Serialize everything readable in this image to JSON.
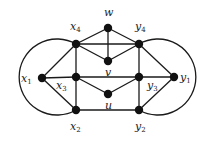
{
  "graph": {
    "nodes": [
      {
        "id": "w",
        "label": "w",
        "sub": "",
        "x": 108,
        "y": 28,
        "lx": 104,
        "ly": 16
      },
      {
        "id": "x4",
        "label": "x",
        "sub": "4",
        "x": 76,
        "y": 44,
        "lx": 70,
        "ly": 30
      },
      {
        "id": "y4",
        "label": "y",
        "sub": "4",
        "x": 139,
        "y": 44,
        "lx": 135,
        "ly": 30
      },
      {
        "id": "v",
        "label": "v",
        "sub": "",
        "x": 108,
        "y": 61,
        "lx": 105,
        "ly": 76
      },
      {
        "id": "x1",
        "label": "x",
        "sub": "1",
        "x": 42,
        "y": 78,
        "lx": 21,
        "ly": 82
      },
      {
        "id": "x3",
        "label": "x",
        "sub": "3",
        "x": 76,
        "y": 77,
        "lx": 56,
        "ly": 89
      },
      {
        "id": "y3",
        "label": "y",
        "sub": "3",
        "x": 139,
        "y": 77,
        "lx": 147,
        "ly": 89
      },
      {
        "id": "y1",
        "label": "y",
        "sub": "1",
        "x": 174,
        "y": 77,
        "lx": 180,
        "ly": 81
      },
      {
        "id": "u",
        "label": "u",
        "sub": "",
        "x": 108,
        "y": 94,
        "lx": 105,
        "ly": 109
      },
      {
        "id": "x2",
        "label": "x",
        "sub": "2",
        "x": 76,
        "y": 110,
        "lx": 70,
        "ly": 130
      },
      {
        "id": "y2",
        "label": "y",
        "sub": "2",
        "x": 139,
        "y": 110,
        "lx": 135,
        "ly": 130
      }
    ],
    "edges": [
      [
        "w",
        "x4"
      ],
      [
        "w",
        "y4"
      ],
      [
        "w",
        "v"
      ],
      [
        "x4",
        "y4"
      ],
      [
        "x4",
        "v"
      ],
      [
        "y4",
        "v"
      ],
      [
        "x4",
        "x1"
      ],
      [
        "x4",
        "x3"
      ],
      [
        "y4",
        "y3"
      ],
      [
        "y4",
        "y1"
      ],
      [
        "x1",
        "x3"
      ],
      [
        "x3",
        "y3"
      ],
      [
        "y3",
        "y1"
      ],
      [
        "x3",
        "u"
      ],
      [
        "y3",
        "u"
      ],
      [
        "x1",
        "x2"
      ],
      [
        "x3",
        "x2"
      ],
      [
        "x2",
        "y2"
      ],
      [
        "y3",
        "y2"
      ],
      [
        "y2",
        "y1"
      ]
    ],
    "arcs": [
      {
        "from": "x4",
        "to": "x2",
        "d": "M76,44 A38,38 0 1 0 76,110"
      },
      {
        "from": "y4",
        "to": "y2",
        "d": "M139,44 A38,38 0 1 1 139,110"
      }
    ],
    "style": {
      "stroke": "#1a1a1a",
      "node_fill": "#111111",
      "node_radius": 4.2
    }
  }
}
